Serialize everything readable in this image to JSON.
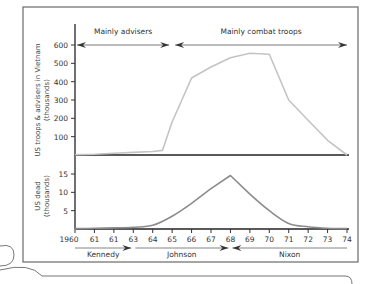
{
  "chart_data": [
    {
      "type": "line",
      "title": "",
      "ylabel": "US troops & advisers in Vietnam",
      "ylabel_sub": "(thousands)",
      "xlabel": "",
      "x": [
        1960,
        1961,
        1962,
        1963,
        1964,
        1964.5,
        1965,
        1966,
        1967,
        1968,
        1969,
        1970,
        1971,
        1972,
        1973,
        1974
      ],
      "series": [
        {
          "name": "US troops & advisers",
          "color": "#c4c4c4",
          "values": [
            1,
            4,
            9,
            14,
            19,
            25,
            180,
            420,
            480,
            530,
            555,
            550,
            300,
            190,
            80,
            0
          ]
        }
      ],
      "ylim": [
        0,
        650
      ],
      "yticks": [
        100,
        200,
        300,
        400,
        500,
        600
      ],
      "ytick_labels": [
        "100",
        "200",
        "300",
        "400",
        "500",
        "600"
      ],
      "annotations": [
        {
          "text": "Mainly advisers",
          "from": 1960,
          "to": 1965
        },
        {
          "text": "Mainly combat troops",
          "from": 1965,
          "to": 1974
        }
      ],
      "grid": false
    },
    {
      "type": "line",
      "ylabel": "US dead",
      "ylabel_sub": "(thousands)",
      "x": [
        1960,
        1961,
        1962,
        1963,
        1964,
        1965,
        1966,
        1967,
        1968,
        1969,
        1970,
        1971,
        1972,
        1973,
        1974
      ],
      "series": [
        {
          "name": "US dead",
          "color": "#8c8c8c",
          "values": [
            0.1,
            0.2,
            0.3,
            0.5,
            1.0,
            3.5,
            7.0,
            11.0,
            14.6,
            9.5,
            5.0,
            1.5,
            0.6,
            0.2,
            0.1
          ]
        }
      ],
      "ylim": [
        0,
        18
      ],
      "yticks": [
        5,
        10,
        15
      ],
      "ytick_labels": [
        "5",
        "10",
        "15"
      ],
      "grid": false
    }
  ],
  "xaxis": {
    "tick_years": [
      1960,
      1961,
      1962,
      1963,
      1964,
      1965,
      1966,
      1967,
      1968,
      1969,
      1970,
      1971,
      1972,
      1973,
      1974
    ],
    "tick_labels": [
      "1960",
      "61",
      "61",
      "63",
      "64",
      "65",
      "66",
      "67",
      "68",
      "69",
      "70",
      "71",
      "72",
      "73",
      "74"
    ]
  },
  "presidents": [
    {
      "name": "Kennedy",
      "from": 1960,
      "to": 1963
    },
    {
      "name": "Johnson",
      "from": 1963,
      "to": 1968
    },
    {
      "name": "Nixon",
      "from": 1968,
      "to": 1974
    }
  ]
}
